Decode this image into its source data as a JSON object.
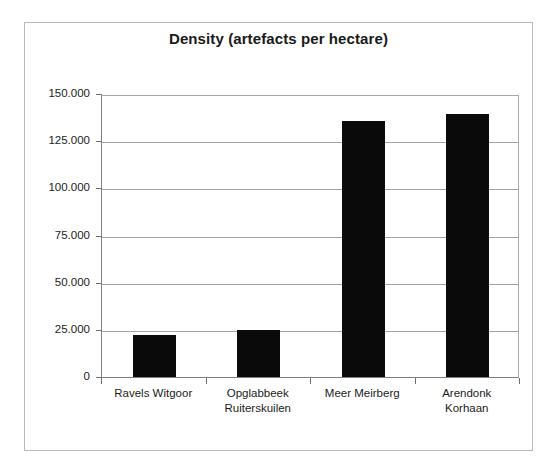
{
  "chart": {
    "title": "Density (artefacts per hectare)",
    "frame_color": "#b9b9b9",
    "bar_color": "#0a0a0a",
    "gridline_color": "#a3a3a3",
    "axis_color": "#808080"
  },
  "chart_data": {
    "type": "bar",
    "title": "Density (artefacts per hectare)",
    "xlabel": "",
    "ylabel": "",
    "categories": [
      "Ravels Witgoor",
      "Opglabbeek Ruiterskuilen",
      "Meer Meirberg",
      "Arendonk Korhaan"
    ],
    "category_lines": [
      [
        "Ravels Witgoor"
      ],
      [
        "Opglabbeek",
        "Ruiterskuilen"
      ],
      [
        "Meer Meirberg"
      ],
      [
        "Arendonk",
        "Korhaan"
      ]
    ],
    "values": [
      22400,
      24800,
      135500,
      139500
    ],
    "ylim": [
      0,
      150000
    ],
    "ytick_values": [
      0,
      25000,
      50000,
      75000,
      100000,
      125000,
      150000
    ],
    "ytick_labels": [
      "0",
      "25.000",
      "50.000",
      "75.000",
      "100.000",
      "125.000",
      "150.000"
    ],
    "grid": true,
    "grid_axis": "y",
    "legend": false,
    "series": [
      {
        "name": "Density",
        "values": [
          22400,
          24800,
          135500,
          139500
        ]
      }
    ]
  }
}
